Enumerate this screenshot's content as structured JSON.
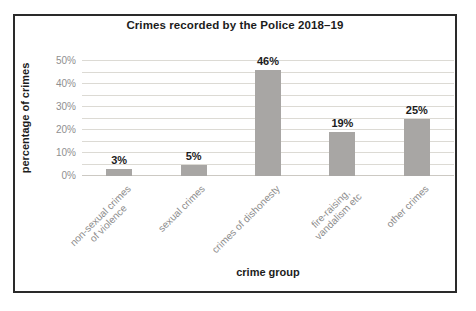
{
  "chart_data": {
    "type": "bar",
    "title": "Crimes recorded by the Police 2018–19",
    "xlabel": "crime group",
    "ylabel": "percentage of crimes",
    "categories": [
      "non-sexual crimes of violence",
      "sexual crimes",
      "crimes of dishonesty",
      "fire-raising, vandalism etc",
      "other crimes"
    ],
    "category_lines": [
      [
        "non-sexual crimes",
        "of violence"
      ],
      [
        "sexual crimes"
      ],
      [
        "crimes of dishonesty"
      ],
      [
        "fire-raising,",
        "vandalism etc"
      ],
      [
        "other crimes"
      ]
    ],
    "values": [
      3,
      5,
      46,
      19,
      25
    ],
    "data_labels": [
      "3%",
      "5%",
      "46%",
      "19%",
      "25%"
    ],
    "yticks": [
      {
        "value": 0,
        "label": "0%"
      },
      {
        "value": 10,
        "label": "10%"
      },
      {
        "value": 20,
        "label": "20%"
      },
      {
        "value": 30,
        "label": "30%"
      },
      {
        "value": 40,
        "label": "40%"
      },
      {
        "value": 50,
        "label": "50%"
      }
    ],
    "ylim": [
      0,
      50
    ],
    "grid": "horizontal minor gridlines every 5%",
    "legend": "none",
    "bar_color": "#a8a6a4",
    "gridline_color": "#dcdad4",
    "tick_text_color": "#8f8f8f",
    "label_text_color": "#1c1c1c",
    "frame_border_color": "#2a2a2a"
  }
}
